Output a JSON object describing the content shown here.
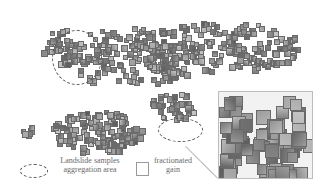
{
  "figure": {
    "inset": {
      "x": 218,
      "y": 91,
      "w": 95,
      "h": 88
    },
    "leader_line": {
      "x1": 186,
      "y1": 146,
      "x2": 218,
      "y2": 178
    },
    "clusters": [
      {
        "cx": 60,
        "cy": 45,
        "rx": 20,
        "ry": 18,
        "n": 40,
        "size": 5
      },
      {
        "cx": 130,
        "cy": 55,
        "rx": 70,
        "ry": 30,
        "n": 180,
        "size": 5
      },
      {
        "cx": 220,
        "cy": 45,
        "rx": 80,
        "ry": 25,
        "n": 170,
        "size": 5
      },
      {
        "cx": 95,
        "cy": 130,
        "rx": 45,
        "ry": 22,
        "n": 150,
        "size": 5
      },
      {
        "cx": 170,
        "cy": 105,
        "rx": 25,
        "ry": 15,
        "n": 40,
        "size": 5
      },
      {
        "cx": 25,
        "cy": 128,
        "rx": 6,
        "ry": 5,
        "n": 6,
        "size": 5
      }
    ],
    "ellipses": [
      {
        "x": 52,
        "y": 30,
        "w": 50,
        "h": 55
      },
      {
        "x": 158,
        "y": 118,
        "w": 45,
        "h": 24
      }
    ]
  },
  "legend": {
    "aggregation_label": "Landslide samples\naggregation area",
    "fractionated_label": "fractionated\ngain"
  }
}
